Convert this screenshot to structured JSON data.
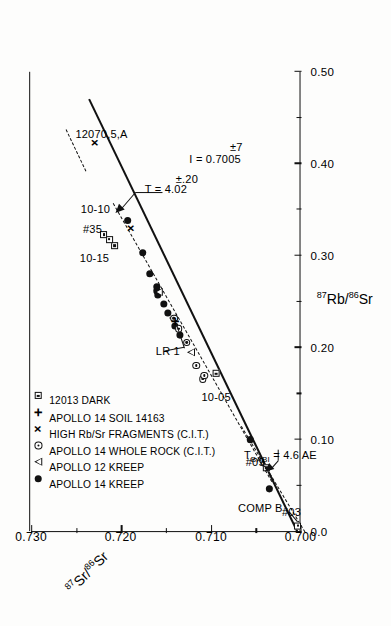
{
  "figure": {
    "kind": "rb-sr-isochron",
    "orientation": "rotated-90-ccw",
    "background": "#fdfdfc",
    "ink": "#111111"
  },
  "chart_data": {
    "type": "scatter",
    "title": "",
    "xlabel": "87Rb/86Sr",
    "ylabel": "87Sr/86Sr",
    "xlabel_parts": {
      "sup": "87",
      "base": "Rb/",
      "sup2": "86",
      "base2": "Sr"
    },
    "ylabel_parts": {
      "sup": "87",
      "base": "Sr/",
      "sup2": "86",
      "base2": "Sr"
    },
    "xlim": [
      0.0,
      0.5
    ],
    "ylim": [
      0.7,
      0.73
    ],
    "xticks": [
      0.0,
      0.1,
      0.2,
      0.3,
      0.4,
      0.5
    ],
    "xticklabels": [
      "0.0",
      "0.10",
      "0.20",
      "0.30",
      "0.40",
      "0.50"
    ],
    "xminorticks": [
      0.05,
      0.15,
      0.25,
      0.35,
      0.45
    ],
    "yticks": [
      0.7,
      0.71,
      0.72,
      0.73
    ],
    "yticklabels": [
      "0.700",
      "0.710",
      "0.720",
      "0.730"
    ],
    "yminorticks": [
      0.705,
      0.715,
      0.725
    ],
    "grid": false,
    "legend_position": "upper-left-inside",
    "series": [
      {
        "name": "APOLLO 14 KREEP",
        "symbol": "filled-circle",
        "points": [
          [
            0.047,
            0.7035
          ],
          [
            0.1,
            0.7056
          ],
          [
            0.214,
            0.7134
          ],
          [
            0.224,
            0.714
          ],
          [
            0.238,
            0.7148
          ],
          [
            0.248,
            0.7152
          ],
          [
            0.258,
            0.7159
          ],
          [
            0.262,
            0.716
          ],
          [
            0.266,
            0.716
          ],
          [
            0.281,
            0.7168
          ],
          [
            0.303,
            0.7176
          ],
          [
            0.338,
            0.7193
          ]
        ]
      },
      {
        "name": "APOLLO 12 KREEP",
        "symbol": "open-triangle",
        "points": [
          [
            0.195,
            0.7122
          ],
          [
            0.232,
            0.7142
          ],
          [
            0.261,
            0.7158
          ]
        ]
      },
      {
        "name": "APOLLO 14 WHOLE ROCK (C.I.T.)",
        "symbol": "circle-with-dot",
        "points": [
          [
            0.166,
            0.7109
          ],
          [
            0.17,
            0.7107
          ],
          [
            0.181,
            0.7116
          ],
          [
            0.206,
            0.7127
          ],
          [
            0.221,
            0.7136
          ],
          [
            0.232,
            0.7141
          ]
        ]
      },
      {
        "name": "HIGH Rb/Sr FRAGMENTS (C.I.T.)",
        "symbol": "cross-x",
        "points": [
          [
            0.33,
            0.7189
          ],
          [
            0.423,
            0.723
          ]
        ]
      },
      {
        "name": "APOLLO 14 SOIL 14163",
        "symbol": "plus",
        "points": [
          [
            0.229,
            0.714
          ]
        ]
      },
      {
        "name": "12013 DARK",
        "symbol": "dotted-square",
        "points": [
          [
            0.007,
            0.7003
          ],
          [
            0.07,
            0.7038
          ],
          [
            0.172,
            0.7094
          ],
          [
            0.311,
            0.7207
          ],
          [
            0.318,
            0.7213
          ],
          [
            0.323,
            0.7219
          ]
        ]
      }
    ],
    "fit_lines": [
      {
        "name": "isochron-solid",
        "style": "solid",
        "x0": 0.0,
        "y0": 0.7005,
        "x1": 0.47,
        "y1": 0.7237
      },
      {
        "name": "isochron-dashed-upper",
        "style": "dashed",
        "x0": 0.055,
        "y0": 0.7032,
        "x1": 0.358,
        "y1": 0.7209
      },
      {
        "name": "babi-dashed-lower",
        "style": "dashed",
        "x0": 0.0,
        "y0": 0.6995,
        "x1": 0.115,
        "y1": 0.7066
      },
      {
        "name": "dashed-fragment-upper",
        "style": "dashed",
        "x0": 0.392,
        "y0": 0.724,
        "x1": 0.437,
        "y1": 0.7262
      }
    ],
    "annotations": [
      {
        "name": "sample-12070",
        "text": "12070,5,A",
        "x": 0.432,
        "y": 0.7222
      },
      {
        "name": "age-value",
        "text": "T = 4.02",
        "x": 0.372,
        "y": 0.715
      },
      {
        "name": "age-error",
        "text": "±.20",
        "x": 0.383,
        "y": 0.7127
      },
      {
        "name": "intercept-value",
        "text": "I = 0.7005",
        "x": 0.405,
        "y": 0.7095
      },
      {
        "name": "intercept-error",
        "text": "±7",
        "x": 0.418,
        "y": 0.7072
      },
      {
        "name": "label-10-10",
        "text": "10-10",
        "x": 0.352,
        "y": 0.7228
      },
      {
        "name": "label-35",
        "text": "#35",
        "x": 0.33,
        "y": 0.7232
      },
      {
        "name": "label-10-15",
        "text": "10-15",
        "x": 0.298,
        "y": 0.723
      },
      {
        "name": "label-10-05",
        "text": "10-05",
        "x": 0.146,
        "y": 0.7094
      },
      {
        "name": "label-lr1",
        "text": "LR 1",
        "x": 0.196,
        "y": 0.7148
      },
      {
        "name": "label-comp-b",
        "text": "COMP B",
        "x": 0.026,
        "y": 0.7045
      },
      {
        "name": "label-09",
        "text": "#09",
        "x": 0.076,
        "y": 0.705
      },
      {
        "name": "label-03",
        "text": "#03",
        "x": 0.022,
        "y": 0.701
      },
      {
        "name": "label-tbabi",
        "text": "T",
        "sub": "BABI",
        "rest": "= 4.6 AE",
        "full": "T_BABI = 4.6 AE",
        "x": 0.082,
        "y": 0.7022
      }
    ]
  },
  "legend": {
    "items": [
      {
        "symbol": "filled-circle",
        "label": "APOLLO 14 KREEP"
      },
      {
        "symbol": "open-triangle",
        "label": "APOLLO 12 KREEP"
      },
      {
        "symbol": "circle-with-dot",
        "label": "APOLLO 14 WHOLE ROCK (C.I.T.)"
      },
      {
        "symbol": "cross-x",
        "label": "HIGH Rb/Sr FRAGMENTS (C.I.T.)"
      },
      {
        "symbol": "plus",
        "label": "APOLLO 14 SOIL 14163"
      },
      {
        "symbol": "dotted-square",
        "label": "12013 DARK"
      }
    ]
  }
}
